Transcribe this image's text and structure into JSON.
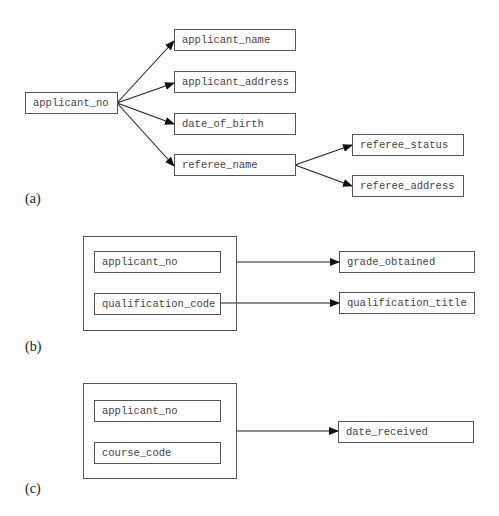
{
  "diagrams": {
    "a": {
      "label": "(a)",
      "determinant": "applicant_no",
      "dependents": [
        "applicant_name",
        "applicant_address",
        "date_of_birth",
        "referee_name"
      ],
      "sub_determinant": "referee_name",
      "sub_dependents": [
        "referee_status",
        "referee_address"
      ]
    },
    "b": {
      "label": "(b)",
      "composite_key": [
        "applicant_no",
        "qualification_code"
      ],
      "dependents": [
        "grade_obtained",
        "qualification_title"
      ],
      "edges": [
        {
          "from": "composite_key",
          "to": "grade_obtained"
        },
        {
          "from": "qualification_code",
          "to": "qualification_title"
        }
      ]
    },
    "c": {
      "label": "(c)",
      "composite_key": [
        "applicant_no",
        "course_code"
      ],
      "dependents": [
        "date_received"
      ],
      "edges": [
        {
          "from": "composite_key",
          "to": "date_received"
        }
      ]
    }
  }
}
